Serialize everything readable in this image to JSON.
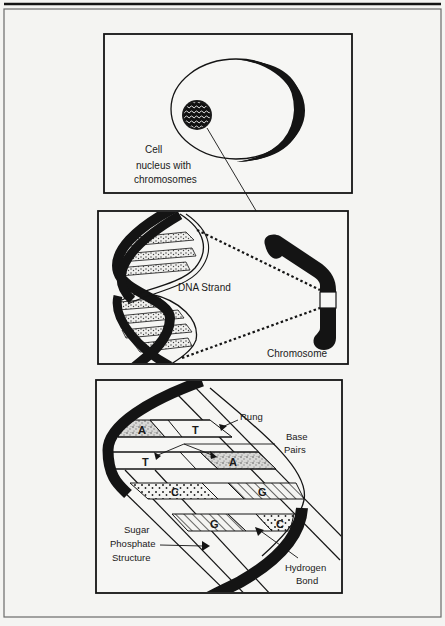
{
  "figure": {
    "colors": {
      "ink": "#141414",
      "paper": "#f4f4f2",
      "frame": "#3a3a3a"
    },
    "panels": {
      "cell": {
        "label_cell": "Cell",
        "label_nucleus_line1": "nucleus with",
        "label_nucleus_line2": "chromosomes"
      },
      "dna": {
        "label_strand": "DNA Strand",
        "label_chromosome": "Chromosome"
      },
      "base_pairs": {
        "label_rung": "Rung",
        "label_base_line1": "Base",
        "label_base_line2": "Pairs",
        "label_sugar_line1": "Sugar",
        "label_sugar_line2": "Phosphate",
        "label_sugar_line3": "Structure",
        "label_hydrogen_line1": "Hydrogen",
        "label_hydrogen_line2": "Bond",
        "bases": [
          {
            "letter": "A"
          },
          {
            "letter": "T"
          },
          {
            "letter": "T"
          },
          {
            "letter": "A"
          },
          {
            "letter": "C"
          },
          {
            "letter": "G"
          },
          {
            "letter": "G"
          },
          {
            "letter": "C"
          }
        ]
      }
    }
  }
}
